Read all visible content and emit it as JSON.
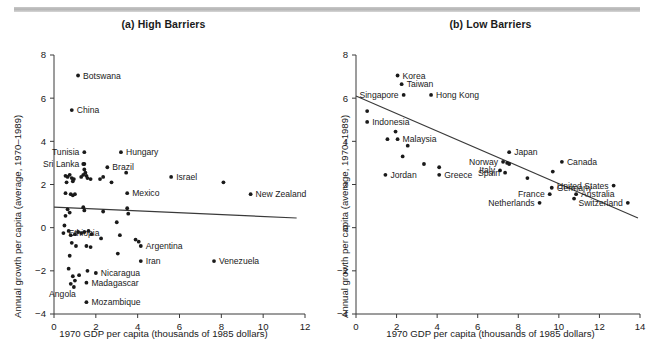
{
  "figure": {
    "rule_name": "top-divider-rule"
  },
  "panels": [
    {
      "id": "a",
      "title": "(a) High Barriers",
      "xlabel": "1970 GDP per capita (thousands of 1985 dollars)",
      "ylabel": "Annual growth per capita (average, 1970–1989)"
    },
    {
      "id": "b",
      "title": "(b) Low Barriers",
      "xlabel": "1970 GDP per capita (thousands of 1985 dollars)",
      "ylabel": "Annual growth per capita (average, 1970–1989)"
    }
  ],
  "chart_data": [
    {
      "type": "scatter",
      "panel": "a",
      "title": "(a) High Barriers",
      "xlabel": "1970 GDP per capita (thousands of 1985 dollars)",
      "ylabel": "Annual growth per capita (average, 1970–1989)",
      "xlim": [
        0,
        12
      ],
      "ylim": [
        -4,
        8
      ],
      "xticks": [
        0,
        2,
        4,
        6,
        8,
        10,
        12
      ],
      "yticks": [
        -4,
        -2,
        0,
        2,
        4,
        6,
        8
      ],
      "grid": false,
      "legend": "none",
      "fit_line": {
        "x0": 0.0,
        "y0": 0.95,
        "x1": 11.6,
        "y1": 0.45
      },
      "points": [
        {
          "x": 1.15,
          "y": 7.05,
          "label": "Botswana",
          "pos": "right"
        },
        {
          "x": 0.85,
          "y": 5.45,
          "label": "China",
          "pos": "right"
        },
        {
          "x": 1.45,
          "y": 3.5,
          "label": "Tunisia",
          "pos": "left"
        },
        {
          "x": 1.45,
          "y": 2.95,
          "label": "Sri Lanka",
          "pos": "left"
        },
        {
          "x": 3.2,
          "y": 3.5,
          "label": "Hungary",
          "pos": "right"
        },
        {
          "x": 2.55,
          "y": 2.8,
          "label": "Brazil",
          "pos": "right"
        },
        {
          "x": 3.5,
          "y": 1.6,
          "label": "Mexico",
          "pos": "right"
        },
        {
          "x": 5.6,
          "y": 2.35,
          "label": "Israel",
          "pos": "right"
        },
        {
          "x": 9.4,
          "y": 1.55,
          "label": "New Zealand",
          "pos": "right"
        },
        {
          "x": 0.45,
          "y": -0.25,
          "label": "Ethiopia",
          "pos": "right"
        },
        {
          "x": 4.15,
          "y": -0.85,
          "label": "Argentina",
          "pos": "right"
        },
        {
          "x": 4.15,
          "y": -1.55,
          "label": "Iran",
          "pos": "right"
        },
        {
          "x": 7.65,
          "y": -1.55,
          "label": "Venezuela",
          "pos": "right"
        },
        {
          "x": 2.0,
          "y": -2.1,
          "label": "Nicaragua",
          "pos": "right"
        },
        {
          "x": 1.55,
          "y": -2.55,
          "label": "Madagascar",
          "pos": "right"
        },
        {
          "x": 0.95,
          "y": -2.75,
          "label": "Angola",
          "pos": "left-below"
        },
        {
          "x": 1.55,
          "y": -3.45,
          "label": "Mozambique",
          "pos": "right"
        },
        {
          "x": 8.1,
          "y": 2.1,
          "label": "",
          "pos": ""
        },
        {
          "x": 1.4,
          "y": 2.95,
          "label": "",
          "pos": ""
        },
        {
          "x": 1.45,
          "y": 2.7,
          "label": "",
          "pos": ""
        },
        {
          "x": 1.5,
          "y": 2.55,
          "label": "",
          "pos": ""
        },
        {
          "x": 1.4,
          "y": 2.45,
          "label": "",
          "pos": ""
        },
        {
          "x": 1.55,
          "y": 2.4,
          "label": "",
          "pos": ""
        },
        {
          "x": 1.6,
          "y": 2.3,
          "label": "",
          "pos": ""
        },
        {
          "x": 1.75,
          "y": 2.25,
          "label": "",
          "pos": ""
        },
        {
          "x": 1.3,
          "y": 2.35,
          "label": "",
          "pos": ""
        },
        {
          "x": 0.55,
          "y": 2.4,
          "label": "",
          "pos": ""
        },
        {
          "x": 0.65,
          "y": 2.35,
          "label": "",
          "pos": ""
        },
        {
          "x": 0.75,
          "y": 2.45,
          "label": "",
          "pos": ""
        },
        {
          "x": 0.85,
          "y": 2.3,
          "label": "",
          "pos": ""
        },
        {
          "x": 0.95,
          "y": 2.25,
          "label": "",
          "pos": ""
        },
        {
          "x": 0.6,
          "y": 2.1,
          "label": "",
          "pos": ""
        },
        {
          "x": 0.9,
          "y": 2.15,
          "label": "",
          "pos": ""
        },
        {
          "x": 0.55,
          "y": 1.6,
          "label": "",
          "pos": ""
        },
        {
          "x": 0.8,
          "y": 1.55,
          "label": "",
          "pos": ""
        },
        {
          "x": 0.9,
          "y": 1.5,
          "label": "",
          "pos": ""
        },
        {
          "x": 1.0,
          "y": 1.55,
          "label": "",
          "pos": ""
        },
        {
          "x": 2.2,
          "y": 2.25,
          "label": "",
          "pos": ""
        },
        {
          "x": 2.35,
          "y": 2.35,
          "label": "",
          "pos": ""
        },
        {
          "x": 2.75,
          "y": 2.1,
          "label": "",
          "pos": ""
        },
        {
          "x": 3.45,
          "y": 2.55,
          "label": "",
          "pos": ""
        },
        {
          "x": 0.65,
          "y": 0.85,
          "label": "",
          "pos": ""
        },
        {
          "x": 0.75,
          "y": 0.7,
          "label": "",
          "pos": ""
        },
        {
          "x": 0.55,
          "y": 0.55,
          "label": "",
          "pos": ""
        },
        {
          "x": 1.4,
          "y": 0.95,
          "label": "",
          "pos": ""
        },
        {
          "x": 1.45,
          "y": 0.8,
          "label": "",
          "pos": ""
        },
        {
          "x": 2.35,
          "y": 0.75,
          "label": "",
          "pos": ""
        },
        {
          "x": 3.5,
          "y": 0.9,
          "label": "",
          "pos": ""
        },
        {
          "x": 3.55,
          "y": 0.65,
          "label": "",
          "pos": ""
        },
        {
          "x": 0.5,
          "y": 0.1,
          "label": "",
          "pos": ""
        },
        {
          "x": 0.7,
          "y": -0.15,
          "label": "",
          "pos": ""
        },
        {
          "x": 0.8,
          "y": -0.35,
          "label": "",
          "pos": ""
        },
        {
          "x": 1.0,
          "y": -0.3,
          "label": "",
          "pos": ""
        },
        {
          "x": 1.15,
          "y": -0.2,
          "label": "",
          "pos": ""
        },
        {
          "x": 1.3,
          "y": -0.25,
          "label": "",
          "pos": ""
        },
        {
          "x": 1.45,
          "y": -0.2,
          "label": "",
          "pos": ""
        },
        {
          "x": 1.65,
          "y": -0.15,
          "label": "",
          "pos": ""
        },
        {
          "x": 1.8,
          "y": -0.3,
          "label": "",
          "pos": ""
        },
        {
          "x": 2.25,
          "y": -0.5,
          "label": "",
          "pos": ""
        },
        {
          "x": 3.0,
          "y": 0.25,
          "label": "",
          "pos": ""
        },
        {
          "x": 3.15,
          "y": -0.35,
          "label": "",
          "pos": ""
        },
        {
          "x": 3.9,
          "y": -0.55,
          "label": "",
          "pos": ""
        },
        {
          "x": 4.05,
          "y": -0.65,
          "label": "",
          "pos": ""
        },
        {
          "x": 0.85,
          "y": -0.7,
          "label": "",
          "pos": ""
        },
        {
          "x": 1.05,
          "y": -0.85,
          "label": "",
          "pos": ""
        },
        {
          "x": 1.55,
          "y": -0.85,
          "label": "",
          "pos": ""
        },
        {
          "x": 1.75,
          "y": -0.9,
          "label": "",
          "pos": ""
        },
        {
          "x": 3.05,
          "y": -1.2,
          "label": "",
          "pos": ""
        },
        {
          "x": 0.75,
          "y": -1.3,
          "label": "",
          "pos": ""
        },
        {
          "x": 0.7,
          "y": -1.9,
          "label": "",
          "pos": ""
        },
        {
          "x": 1.6,
          "y": -2.0,
          "label": "",
          "pos": ""
        },
        {
          "x": 0.9,
          "y": -2.25,
          "label": "",
          "pos": ""
        },
        {
          "x": 1.0,
          "y": -2.45,
          "label": "",
          "pos": ""
        },
        {
          "x": 1.2,
          "y": -2.2,
          "label": "",
          "pos": ""
        },
        {
          "x": 0.8,
          "y": -2.6,
          "label": "",
          "pos": ""
        }
      ]
    },
    {
      "type": "scatter",
      "panel": "b",
      "title": "(b) Low Barriers",
      "xlabel": "1970 GDP per capita (thousands of 1985 dollars)",
      "ylabel": "Annual growth per capita (average, 1970–1989)",
      "xlim": [
        0,
        14
      ],
      "ylim": [
        -4,
        8
      ],
      "xticks": [
        0,
        2,
        4,
        6,
        8,
        10,
        12,
        14
      ],
      "yticks": [
        -4,
        -2,
        0,
        2,
        4,
        6,
        8
      ],
      "grid": false,
      "legend": "none",
      "fit_line": {
        "x0": 0.0,
        "y0": 6.1,
        "x1": 13.9,
        "y1": 0.45
      },
      "points": [
        {
          "x": 2.05,
          "y": 7.05,
          "label": "Korea",
          "pos": "right"
        },
        {
          "x": 2.25,
          "y": 6.65,
          "label": "Taiwan",
          "pos": "right"
        },
        {
          "x": 2.35,
          "y": 6.15,
          "label": "Singapore",
          "pos": "left"
        },
        {
          "x": 3.7,
          "y": 6.15,
          "label": "Hong Kong",
          "pos": "right"
        },
        {
          "x": 0.55,
          "y": 5.4,
          "label": "",
          "pos": ""
        },
        {
          "x": 0.55,
          "y": 4.9,
          "label": "Indonesia",
          "pos": "right"
        },
        {
          "x": 1.95,
          "y": 4.45,
          "label": "",
          "pos": ""
        },
        {
          "x": 1.55,
          "y": 4.1,
          "label": "",
          "pos": ""
        },
        {
          "x": 2.05,
          "y": 4.1,
          "label": "Malaysia",
          "pos": "right"
        },
        {
          "x": 2.55,
          "y": 3.8,
          "label": "",
          "pos": ""
        },
        {
          "x": 2.3,
          "y": 3.3,
          "label": "",
          "pos": ""
        },
        {
          "x": 7.55,
          "y": 3.5,
          "label": "Japan",
          "pos": "right"
        },
        {
          "x": 7.25,
          "y": 3.05,
          "label": "Norway",
          "pos": "left"
        },
        {
          "x": 7.45,
          "y": 3.0,
          "label": "",
          "pos": ""
        },
        {
          "x": 7.55,
          "y": 2.95,
          "label": "",
          "pos": ""
        },
        {
          "x": 10.15,
          "y": 3.05,
          "label": "Canada",
          "pos": "right"
        },
        {
          "x": 7.1,
          "y": 2.65,
          "label": "Italy",
          "pos": "left"
        },
        {
          "x": 7.35,
          "y": 2.55,
          "label": "Spain",
          "pos": "left"
        },
        {
          "x": 1.45,
          "y": 2.45,
          "label": "Jordan",
          "pos": "right"
        },
        {
          "x": 4.1,
          "y": 2.8,
          "label": "",
          "pos": ""
        },
        {
          "x": 4.1,
          "y": 2.45,
          "label": "Greece",
          "pos": "right"
        },
        {
          "x": 3.35,
          "y": 2.95,
          "label": "",
          "pos": ""
        },
        {
          "x": 8.45,
          "y": 2.3,
          "label": "",
          "pos": ""
        },
        {
          "x": 9.7,
          "y": 2.6,
          "label": "",
          "pos": ""
        },
        {
          "x": 12.7,
          "y": 1.95,
          "label": "United States",
          "pos": "left"
        },
        {
          "x": 9.65,
          "y": 1.85,
          "label": "Germany",
          "pos": "right"
        },
        {
          "x": 10.85,
          "y": 1.55,
          "label": "Australia",
          "pos": "right"
        },
        {
          "x": 9.55,
          "y": 1.55,
          "label": "France",
          "pos": "left"
        },
        {
          "x": 10.75,
          "y": 1.35,
          "label": "",
          "pos": ""
        },
        {
          "x": 9.05,
          "y": 1.15,
          "label": "Netherlands",
          "pos": "left"
        },
        {
          "x": 13.4,
          "y": 1.15,
          "label": "Switzerland",
          "pos": "left"
        }
      ]
    }
  ]
}
